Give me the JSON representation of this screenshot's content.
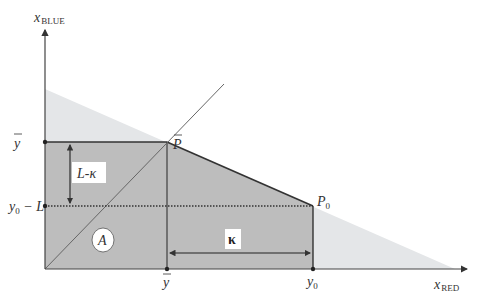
{
  "figure": {
    "type": "budget-constraint-diagram",
    "colors": {
      "background": "#ffffff",
      "light_region": "#e4e6e8",
      "dark_region": "#bdbdbd",
      "axis": "#444444",
      "line": "#333333",
      "diagonal": "#666666",
      "dotted": "#333333"
    },
    "axes": {
      "x_label_main": "x",
      "x_label_sub": "RED",
      "y_label_main": "x",
      "y_label_sub": "BLUE"
    },
    "points": {
      "p_bar": {
        "main": "P",
        "bar": "‾"
      },
      "p0": {
        "main": "P",
        "sub": "0"
      }
    },
    "y_ticks": {
      "y_bar": "y",
      "y0_minus_L_main": "y",
      "y0_minus_L_sub": "0",
      "y0_minus_L_rest": " − L"
    },
    "x_ticks": {
      "y_bar": "y",
      "y0_main": "y",
      "y0_sub": "0"
    },
    "annotations": {
      "vertical_gap_label": "L-κ",
      "horizontal_gap_label": "κ",
      "region_label": "A"
    }
  }
}
